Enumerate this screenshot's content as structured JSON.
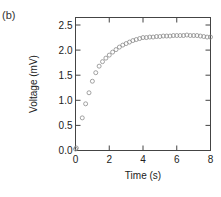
{
  "panel_label": "(b)",
  "chart_data": {
    "type": "scatter",
    "title": "",
    "xlabel": "Time (s)",
    "ylabel": "Voltage (mV)",
    "xlim": [
      0,
      8
    ],
    "ylim": [
      0,
      2.5
    ],
    "xticks": [
      0,
      2,
      4,
      6,
      8
    ],
    "xtick_labels": [
      "0",
      "2",
      "4",
      "6",
      "8"
    ],
    "yticks": [
      0.0,
      0.5,
      1.0,
      1.5,
      2.0,
      2.5
    ],
    "ytick_labels": [
      "0.0",
      "0.5",
      "1.0",
      "1.5",
      "2.0",
      "2.5"
    ],
    "grid": false,
    "legend": null,
    "marker": "open-circle",
    "series": [
      {
        "name": "Voltage",
        "x": [
          0.0,
          0.05,
          0.4,
          0.6,
          0.8,
          1.0,
          1.2,
          1.4,
          1.6,
          1.8,
          2.0,
          2.2,
          2.4,
          2.6,
          2.8,
          3.0,
          3.2,
          3.4,
          3.6,
          3.8,
          4.0,
          4.2,
          4.4,
          4.6,
          4.8,
          5.0,
          5.2,
          5.4,
          5.6,
          5.8,
          6.0,
          6.2,
          6.4,
          6.6,
          6.8,
          7.0,
          7.2,
          7.4,
          7.6,
          7.8,
          8.0
        ],
        "y": [
          0.03,
          0.05,
          0.65,
          0.93,
          1.15,
          1.38,
          1.55,
          1.68,
          1.77,
          1.84,
          1.9,
          1.96,
          2.01,
          2.06,
          2.1,
          2.13,
          2.16,
          2.19,
          2.21,
          2.23,
          2.25,
          2.25,
          2.26,
          2.26,
          2.27,
          2.27,
          2.28,
          2.28,
          2.28,
          2.29,
          2.29,
          2.29,
          2.29,
          2.3,
          2.29,
          2.29,
          2.29,
          2.28,
          2.27,
          2.26,
          2.26
        ]
      }
    ],
    "colors": {
      "marker": "#8a8a8a",
      "axis": "#444444",
      "text": "#222222"
    }
  }
}
